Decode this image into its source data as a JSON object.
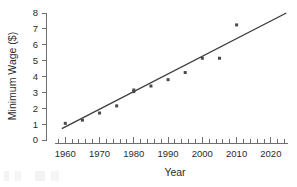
{
  "chart_data": {
    "type": "scatter",
    "title": "",
    "xlabel": "Year",
    "ylabel": "Minimum Wage ($)",
    "xlim": [
      1957,
      2025
    ],
    "ylim": [
      0,
      8
    ],
    "grid": false,
    "legend": "none",
    "x_ticks": [
      1960,
      1970,
      1980,
      1990,
      2000,
      2010,
      2020
    ],
    "x_tick_labels": [
      "1960",
      "1970",
      "1980",
      "1990",
      "2000",
      "2010",
      "2020"
    ],
    "x_minor_step": 2,
    "y_ticks": [
      0,
      1,
      2,
      3,
      4,
      5,
      6,
      7,
      8
    ],
    "y_tick_labels": [
      "0",
      "1",
      "2",
      "3",
      "4",
      "5",
      "6",
      "7",
      "8"
    ],
    "series": [
      {
        "name": "Minimum Wage",
        "marker": "square",
        "color": "#4a4a4a",
        "x": [
          1960,
          1965,
          1970,
          1975,
          1980,
          1980,
          1985,
          1990,
          1995,
          2000,
          2005,
          2010
        ],
        "y": [
          1.05,
          1.25,
          1.7,
          2.15,
          3.05,
          3.15,
          3.4,
          3.8,
          4.25,
          5.15,
          5.15,
          7.25
        ]
      }
    ],
    "trendline": {
      "name": "Least-squares fit",
      "color": "#3a3a3a",
      "x_start": 1959.0,
      "y_start": 0.72,
      "x_end": 2024.5,
      "y_end": 8.0
    },
    "annotations": []
  },
  "axis": {
    "y_title": "Minimum Wage ($)",
    "x_title": "Year"
  }
}
